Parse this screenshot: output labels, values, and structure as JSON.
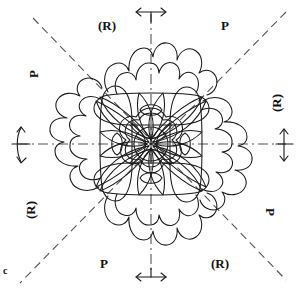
{
  "figure": {
    "caption_letter": "c",
    "colors": {
      "ink": "#1a1a1a",
      "dash": "#444444",
      "background": "#ffffff"
    },
    "symmetry": {
      "order": 4,
      "mirror_lines": 4,
      "axis_style": "dash-dot",
      "diagonal_style": "dashed"
    },
    "labels": [
      {
        "id": "label-top-left",
        "text": "(R)",
        "x": 98,
        "y": 18,
        "rotation": 0
      },
      {
        "id": "label-top-right",
        "text": "P",
        "x": 217,
        "y": 18,
        "rotation": 0
      },
      {
        "id": "label-left-upper",
        "text": "P",
        "x": 32,
        "y": 70,
        "rotation": -90
      },
      {
        "id": "label-right-upper",
        "text": "(R)",
        "x": 275,
        "y": 98,
        "rotation": -90
      },
      {
        "id": "label-left-lower",
        "text": "(R)",
        "x": 32,
        "y": 205,
        "rotation": -90
      },
      {
        "id": "label-right-lower",
        "text": "P",
        "x": 270,
        "y": 207,
        "rotation": 90
      },
      {
        "id": "label-bottom-left",
        "text": "P",
        "x": 100,
        "y": 258,
        "rotation": 0
      },
      {
        "id": "label-bottom-right",
        "text": "(R)",
        "x": 213,
        "y": 258,
        "rotation": 0
      },
      {
        "id": "label-corner-c",
        "text": "c",
        "x": 4,
        "y": 266,
        "rotation": 0
      }
    ],
    "arrow_markers": [
      {
        "id": "arrow-top",
        "orientation": "horizontal-double",
        "x": 151,
        "y": 10
      },
      {
        "id": "arrow-bottom",
        "orientation": "horizontal-double",
        "x": 151,
        "y": 276
      },
      {
        "id": "arrow-left",
        "orientation": "vertical-double",
        "x": 20,
        "y": 144
      },
      {
        "id": "arrow-right",
        "orientation": "vertical-double",
        "x": 284,
        "y": 144
      }
    ],
    "motif": {
      "center": {
        "x": 151,
        "y": 144
      },
      "outer_lobe_count": 4,
      "inner_leaf_count": 4,
      "center_flower_scallops": 6,
      "center_circle_spokes": 6
    }
  }
}
